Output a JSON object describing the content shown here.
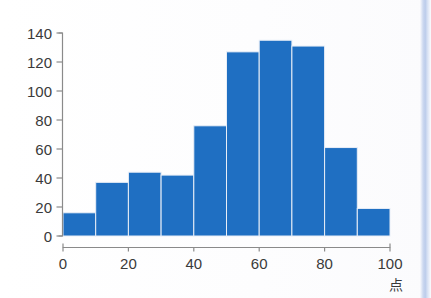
{
  "chart_data": {
    "type": "bar",
    "title": "",
    "subtitle": "",
    "xlabel": "点",
    "ylabel": "",
    "xlim": [
      0,
      100
    ],
    "ylim": [
      0,
      140
    ],
    "grid": false,
    "legend": null,
    "bin_width": 10,
    "categories": [
      "0-10",
      "10-20",
      "20-30",
      "30-40",
      "40-50",
      "50-60",
      "60-70",
      "70-80",
      "80-90",
      "90-100"
    ],
    "bin_edges": [
      0,
      10,
      20,
      30,
      40,
      50,
      60,
      70,
      80,
      90,
      100
    ],
    "values": [
      16,
      37,
      44,
      42,
      76,
      127,
      135,
      131,
      61,
      19
    ],
    "x_ticks": [
      "0",
      "20",
      "40",
      "60",
      "80",
      "100"
    ],
    "x_tick_values": [
      0,
      20,
      40,
      60,
      80,
      100
    ],
    "y_ticks": [
      "0",
      "20",
      "40",
      "60",
      "80",
      "100",
      "120",
      "140"
    ],
    "y_tick_values": [
      0,
      20,
      40,
      60,
      80,
      100,
      120,
      140
    ],
    "bar_color": "#1f6fc2",
    "bar_edge_color": "#e8eef7",
    "axis_color": "#8a8a8a",
    "background_color": "#ffffff"
  },
  "figure": {
    "axis_unit_label": "点",
    "page_edge_color": "#b9caea"
  }
}
